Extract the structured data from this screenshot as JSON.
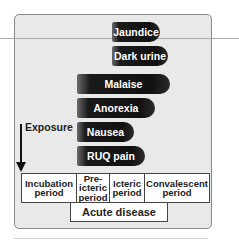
{
  "diagram": {
    "symptoms": [
      {
        "label": "Jaundice",
        "left": 112,
        "top": 22,
        "width": 48
      },
      {
        "label": "Dark urine",
        "left": 112,
        "top": 46,
        "width": 56
      },
      {
        "label": "Malaise",
        "left": 77,
        "top": 74,
        "width": 93
      },
      {
        "label": "Anorexia",
        "left": 77,
        "top": 98,
        "width": 78
      },
      {
        "label": "Nausea",
        "left": 77,
        "top": 122,
        "width": 57
      },
      {
        "label": "RUQ pain",
        "left": 77,
        "top": 146,
        "width": 68
      }
    ],
    "exposure_label": "Exposure",
    "phases": [
      {
        "label": "Incubation\nperiod",
        "width": 55
      },
      {
        "label": "Pre-\nicteric\nperiod",
        "width": 33
      },
      {
        "label": "Icteric\nperiod",
        "width": 35
      },
      {
        "label": "Convalescent\nperiod",
        "width": 64
      }
    ],
    "acute_label": "Acute disease"
  }
}
